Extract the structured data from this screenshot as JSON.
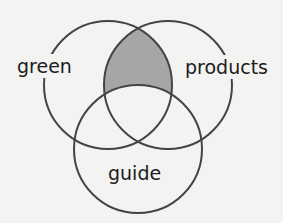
{
  "diagram": {
    "type": "venn",
    "sets": [
      {
        "id": "green",
        "label": "green"
      },
      {
        "id": "products",
        "label": "products"
      },
      {
        "id": "guide",
        "label": "guide"
      }
    ],
    "highlighted_region": "green AND products NOT guide",
    "colors": {
      "stroke": "#444444",
      "shade": "#a6a6a6",
      "background": "#f3f3f1"
    }
  }
}
